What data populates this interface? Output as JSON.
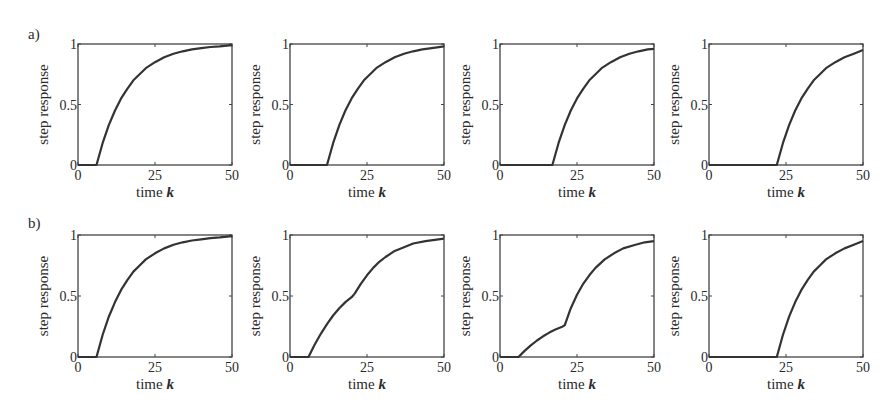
{
  "figure": {
    "row_labels": [
      "a)",
      "b)"
    ],
    "xlabel_prefix": "time ",
    "xlabel_var": "k",
    "ylabel": "step response",
    "xticks": [
      "0",
      "25",
      "50"
    ],
    "yticks": [
      "0",
      "0.5",
      "1"
    ],
    "line_color": "#333333",
    "axis_color": "#444444"
  },
  "chart_data": [
    {
      "type": "line",
      "row": "a",
      "panel": 1,
      "title": "",
      "xlabel": "time k",
      "ylabel": "step response",
      "xlim": [
        0,
        50
      ],
      "ylim": [
        0,
        1
      ],
      "grid": false,
      "x": [
        0,
        6,
        8,
        10,
        12,
        14,
        16,
        18,
        20,
        22,
        25,
        28,
        31,
        34,
        37,
        40,
        43,
        46,
        50
      ],
      "values": [
        0,
        0,
        0.18,
        0.33,
        0.45,
        0.55,
        0.63,
        0.7,
        0.75,
        0.8,
        0.85,
        0.89,
        0.92,
        0.94,
        0.955,
        0.965,
        0.975,
        0.98,
        0.99
      ]
    },
    {
      "type": "line",
      "row": "a",
      "panel": 2,
      "title": "",
      "xlabel": "time k",
      "ylabel": "step response",
      "xlim": [
        0,
        50
      ],
      "ylim": [
        0,
        1
      ],
      "grid": false,
      "x": [
        0,
        12,
        14,
        16,
        18,
        20,
        22,
        24,
        26,
        28,
        31,
        34,
        37,
        40,
        43,
        46,
        50
      ],
      "values": [
        0,
        0,
        0.18,
        0.33,
        0.45,
        0.55,
        0.63,
        0.7,
        0.75,
        0.8,
        0.85,
        0.89,
        0.92,
        0.94,
        0.955,
        0.965,
        0.98
      ]
    },
    {
      "type": "line",
      "row": "a",
      "panel": 3,
      "title": "",
      "xlabel": "time k",
      "ylabel": "step response",
      "xlim": [
        0,
        50
      ],
      "ylim": [
        0,
        1
      ],
      "grid": false,
      "x": [
        0,
        17,
        19,
        21,
        23,
        25,
        27,
        29,
        31,
        33,
        36,
        39,
        42,
        45,
        48,
        50
      ],
      "values": [
        0,
        0,
        0.18,
        0.33,
        0.45,
        0.55,
        0.63,
        0.7,
        0.75,
        0.8,
        0.85,
        0.89,
        0.92,
        0.94,
        0.955,
        0.96
      ]
    },
    {
      "type": "line",
      "row": "a",
      "panel": 4,
      "title": "",
      "xlabel": "time k",
      "ylabel": "step response",
      "xlim": [
        0,
        50
      ],
      "ylim": [
        0,
        1
      ],
      "grid": false,
      "x": [
        0,
        22,
        24,
        26,
        28,
        30,
        32,
        34,
        36,
        38,
        41,
        44,
        47,
        50
      ],
      "values": [
        0,
        0,
        0.18,
        0.33,
        0.45,
        0.55,
        0.63,
        0.7,
        0.75,
        0.8,
        0.85,
        0.89,
        0.92,
        0.95
      ]
    },
    {
      "type": "line",
      "row": "b",
      "panel": 1,
      "title": "",
      "xlabel": "time k",
      "ylabel": "step response",
      "xlim": [
        0,
        50
      ],
      "ylim": [
        0,
        1
      ],
      "grid": false,
      "x": [
        0,
        6,
        8,
        10,
        12,
        14,
        16,
        18,
        20,
        22,
        25,
        28,
        31,
        34,
        37,
        40,
        43,
        46,
        50
      ],
      "values": [
        0,
        0,
        0.18,
        0.33,
        0.45,
        0.55,
        0.63,
        0.7,
        0.75,
        0.8,
        0.85,
        0.89,
        0.92,
        0.94,
        0.955,
        0.965,
        0.975,
        0.98,
        0.99
      ]
    },
    {
      "type": "line",
      "row": "b",
      "panel": 2,
      "title": "",
      "xlabel": "time k",
      "ylabel": "step response",
      "xlim": [
        0,
        50
      ],
      "ylim": [
        0,
        1
      ],
      "grid": false,
      "x": [
        0,
        6,
        8,
        10,
        12,
        14,
        16,
        18,
        20,
        21,
        23,
        25,
        27,
        29,
        31,
        34,
        37,
        40,
        44,
        47,
        50
      ],
      "values": [
        0,
        0,
        0.1,
        0.19,
        0.27,
        0.34,
        0.4,
        0.45,
        0.49,
        0.52,
        0.6,
        0.67,
        0.73,
        0.78,
        0.82,
        0.87,
        0.9,
        0.93,
        0.95,
        0.96,
        0.97
      ]
    },
    {
      "type": "line",
      "row": "b",
      "panel": 3,
      "title": "",
      "xlabel": "time k",
      "ylabel": "step response",
      "xlim": [
        0,
        50
      ],
      "ylim": [
        0,
        1
      ],
      "grid": false,
      "x": [
        0,
        6,
        8,
        10,
        12,
        14,
        16,
        18,
        20,
        21,
        23,
        25,
        27,
        29,
        31,
        34,
        37,
        40,
        44,
        47,
        50
      ],
      "values": [
        0,
        0,
        0.05,
        0.095,
        0.135,
        0.17,
        0.2,
        0.225,
        0.245,
        0.26,
        0.4,
        0.51,
        0.6,
        0.67,
        0.73,
        0.8,
        0.85,
        0.89,
        0.92,
        0.94,
        0.95
      ]
    },
    {
      "type": "line",
      "row": "b",
      "panel": 4,
      "title": "",
      "xlabel": "time k",
      "ylabel": "step response",
      "xlim": [
        0,
        50
      ],
      "ylim": [
        0,
        1
      ],
      "grid": false,
      "x": [
        0,
        22,
        24,
        26,
        28,
        30,
        32,
        34,
        36,
        38,
        41,
        44,
        47,
        50
      ],
      "values": [
        0,
        0,
        0.18,
        0.33,
        0.45,
        0.55,
        0.63,
        0.7,
        0.75,
        0.8,
        0.85,
        0.89,
        0.92,
        0.95
      ]
    }
  ]
}
